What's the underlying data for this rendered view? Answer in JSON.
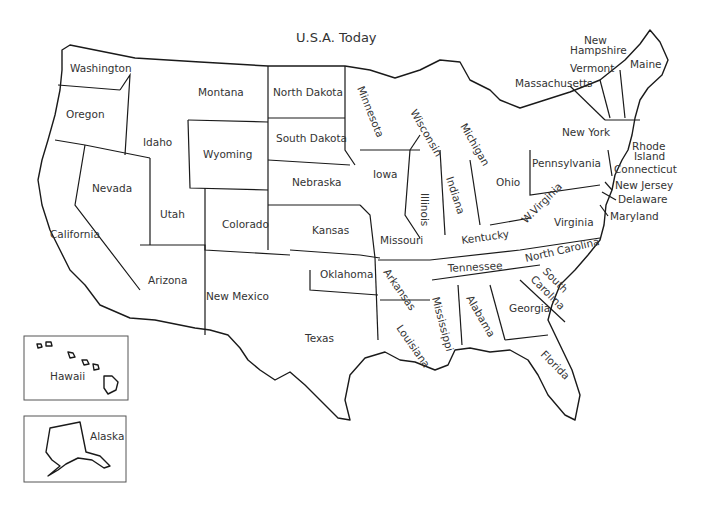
{
  "title": "U.S.A. Today",
  "states": {
    "washington": "Washington",
    "oregon": "Oregon",
    "california": "California",
    "nevada": "Nevada",
    "idaho": "Idaho",
    "montana": "Montana",
    "wyoming": "Wyoming",
    "utah": "Utah",
    "arizona": "Arizona",
    "colorado": "Colorado",
    "new_mexico": "New Mexico",
    "north_dakota": "North Dakota",
    "south_dakota": "South Dakota",
    "nebraska": "Nebraska",
    "kansas": "Kansas",
    "oklahoma": "Oklahoma",
    "texas": "Texas",
    "minnesota": "Minnesota",
    "iowa": "Iowa",
    "missouri": "Missouri",
    "arkansas": "Arkansas",
    "louisiana": "Louisiana",
    "wisconsin": "Wisconsin",
    "illinois": "Illinois",
    "michigan": "Michigan",
    "indiana": "Indiana",
    "ohio": "Ohio",
    "kentucky": "Kentucky",
    "tennessee": "Tennessee",
    "mississippi": "Mississippi",
    "alabama": "Alabama",
    "georgia": "Georgia",
    "florida": "Florida",
    "south_carolina_1": "South",
    "south_carolina_2": "Carolina",
    "north_carolina": "North Carolina",
    "virginia": "Virginia",
    "west_virginia": "W.Virginia",
    "pennsylvania": "Pennsylvania",
    "new_york": "New York",
    "maryland": "Maryland",
    "delaware": "Delaware",
    "new_jersey": "New Jersey",
    "connecticut": "Connecticut",
    "rhode_island_1": "Rhode",
    "rhode_island_2": "Island",
    "massachusetts": "Massachusetts",
    "vermont": "Vermont",
    "new_hampshire_1": "New",
    "new_hampshire_2": "Hampshire",
    "maine": "Maine"
  },
  "insets": {
    "hawaii": "Hawaii",
    "alaska": "Alaska"
  }
}
